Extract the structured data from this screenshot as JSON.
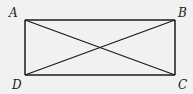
{
  "diagram": {
    "colors": {
      "background": "#f1f1f1",
      "stroke": "#1a1a1a"
    },
    "vertices": [
      {
        "label": "A",
        "x": 25,
        "y": 20,
        "lx": 9,
        "ly": 17
      },
      {
        "label": "B",
        "x": 175,
        "y": 20,
        "lx": 178,
        "ly": 17
      },
      {
        "label": "C",
        "x": 175,
        "y": 75,
        "lx": 178,
        "ly": 89
      },
      {
        "label": "D",
        "x": 25,
        "y": 75,
        "lx": 12,
        "ly": 89
      }
    ],
    "edges": [
      [
        "A",
        "B"
      ],
      [
        "B",
        "C"
      ],
      [
        "C",
        "D"
      ],
      [
        "D",
        "A"
      ],
      [
        "A",
        "C"
      ],
      [
        "B",
        "D"
      ]
    ]
  }
}
